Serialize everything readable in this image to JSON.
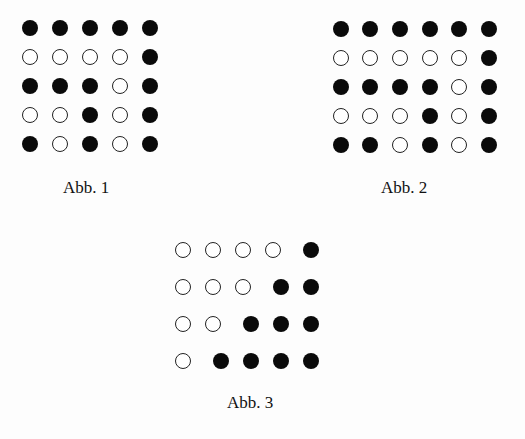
{
  "figures": [
    {
      "id": "abb1",
      "caption": "Abb. 1",
      "origin": [
        22,
        20
      ],
      "col_x": [
        0,
        30,
        60,
        90,
        120
      ],
      "row_y": [
        0,
        29,
        58,
        87,
        116
      ],
      "rows": [
        [
          "f",
          "f",
          "f",
          "f",
          "f"
        ],
        [
          "o",
          "o",
          "o",
          "o",
          "f"
        ],
        [
          "f",
          "f",
          "f",
          "o",
          "f"
        ],
        [
          "o",
          "o",
          "f",
          "o",
          "f"
        ],
        [
          "f",
          "o",
          "f",
          "o",
          "f"
        ]
      ],
      "caption_pos": [
        63,
        178
      ]
    },
    {
      "id": "abb2",
      "caption": "Abb. 2",
      "origin": [
        333,
        21
      ],
      "col_x": [
        0,
        29,
        59,
        89,
        118,
        148
      ],
      "row_y": [
        0,
        29,
        58,
        87,
        116
      ],
      "rows": [
        [
          "f",
          "f",
          "f",
          "f",
          "f",
          "f"
        ],
        [
          "o",
          "o",
          "o",
          "o",
          "o",
          "f"
        ],
        [
          "f",
          "f",
          "f",
          "f",
          "o",
          "f"
        ],
        [
          "o",
          "o",
          "o",
          "f",
          "o",
          "f"
        ],
        [
          "f",
          "f",
          "o",
          "f",
          "o",
          "f"
        ]
      ],
      "caption_pos": [
        381,
        178
      ]
    },
    {
      "id": "abb3",
      "caption": "Abb. 3",
      "origin": [
        175,
        242
      ],
      "col_x": [
        0,
        30,
        60,
        90,
        128
      ],
      "row_y": [
        0,
        37,
        74,
        111
      ],
      "rows": [
        [
          "o",
          "o",
          "o",
          "o",
          "f"
        ],
        [
          "o",
          "o",
          "o",
          "f",
          "f"
        ],
        [
          "o",
          "o",
          "f",
          "f",
          "f"
        ],
        [
          "o",
          "f",
          "f",
          "f",
          "f"
        ]
      ],
      "shift_filled": true,
      "caption_pos": [
        227,
        393
      ]
    }
  ]
}
